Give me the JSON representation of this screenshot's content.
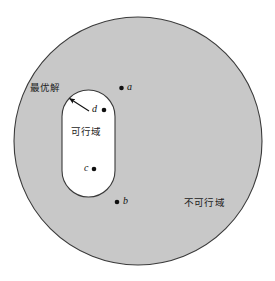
{
  "figure": {
    "colors": {
      "infeasible_fill": "#c8c8c8",
      "feasible_fill": "#ffffff",
      "outline": "#3a3a3a",
      "text": "#1b1b1b",
      "point": "#101010",
      "background": "#ffffff"
    },
    "geometry": {
      "circle": {
        "cx": 138,
        "cy": 141,
        "r": 124
      },
      "stadium": {
        "x": 62,
        "y": 90,
        "width": 53,
        "height": 107,
        "radius": 26.5
      }
    },
    "region_labels": [
      {
        "id": "optimal-solution",
        "text": "最优解",
        "x": 30,
        "y": 83
      },
      {
        "id": "feasible-region",
        "text": "可行域",
        "x": 71,
        "y": 127
      },
      {
        "id": "infeasible-region",
        "text": "不可行域",
        "x": 184,
        "y": 198
      }
    ],
    "annotation_arrow": {
      "id": "optimal-solution-arrow",
      "tail_x": 89,
      "tail_y": 111,
      "tip_x": 69,
      "tip_y": 98
    },
    "points": [
      {
        "id": "a",
        "label": "a",
        "x": 121.5,
        "y": 88,
        "label_x": 127,
        "label_y": 82,
        "region": "infeasible"
      },
      {
        "id": "d",
        "label": "d",
        "x": 104,
        "y": 110,
        "label_x": 92,
        "label_y": 104,
        "region": "feasible"
      },
      {
        "id": "c",
        "label": "c",
        "x": 94,
        "y": 169,
        "label_x": 84,
        "label_y": 163,
        "region": "feasible"
      },
      {
        "id": "b",
        "label": "b",
        "x": 117,
        "y": 202,
        "label_x": 123,
        "label_y": 196,
        "region": "infeasible"
      }
    ]
  }
}
